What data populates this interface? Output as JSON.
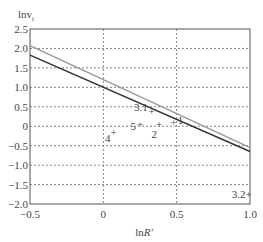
{
  "chart_data": {
    "type": "line",
    "title": "",
    "xlabel": "lnR'",
    "ylabel": "lnv_i",
    "xlim": [
      -0.5,
      1.0
    ],
    "ylim": [
      -2.0,
      2.5
    ],
    "xticks": [
      -0.5,
      0,
      0.5,
      1.0
    ],
    "xtick_labels": [
      "−0.5",
      "0",
      "0.5",
      "1.0"
    ],
    "yticks": [
      -2.0,
      -1.5,
      -1.0,
      -0.5,
      0,
      0.5,
      1.0,
      1.5,
      2.0,
      2.5
    ],
    "ytick_labels": [
      "−2.0",
      "−1.5",
      "−1.0",
      "−0.5",
      "0",
      "0.5",
      "1.0",
      "1.5",
      "2.0",
      "2.5"
    ],
    "grid": true,
    "series": [
      {
        "name": "fit line (dark)",
        "color": "#333333",
        "x": [
          -0.5,
          1.0
        ],
        "y": [
          1.83,
          -0.65
        ]
      },
      {
        "name": "fit line (gray)",
        "color": "#999999",
        "x": [
          -0.5,
          1.0
        ],
        "y": [
          2.07,
          -0.55
        ]
      }
    ],
    "points": [
      {
        "label": "1",
        "x": 0.48,
        "y": 0.12
      },
      {
        "label": "2",
        "x": 0.38,
        "y": 0.05
      },
      {
        "label": "3.1",
        "x": 0.33,
        "y": 0.38
      },
      {
        "label": "4",
        "x": 0.07,
        "y": -0.15
      },
      {
        "label": "5",
        "x": 0.25,
        "y": 0.05
      },
      {
        "label": "3.2",
        "x": 0.99,
        "y": -1.75
      }
    ]
  }
}
